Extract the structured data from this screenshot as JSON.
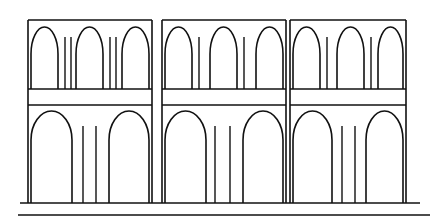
{
  "document": {
    "title": "Two-tier arcade elevation",
    "subject": "aqueduct-viaduct-facade-line-drawing",
    "background_color": "#ffffff",
    "ink_color": "#111111",
    "canvas": {
      "width": 442,
      "height": 223
    }
  },
  "drawing": {
    "type": "architectural-elevation",
    "orientation": "front",
    "bay_count": 3,
    "level_count": 2,
    "stroke_widths": {
      "outline": 1.6,
      "arch": 1.6,
      "pier_line": 1.4,
      "ground": 1.7,
      "ground_secondary": 1.5
    },
    "geometry": {
      "bay_left_edges": [
        28,
        162,
        290
      ],
      "bay_right_edges": [
        152,
        286,
        406
      ],
      "top_y": 20,
      "band_top_y": 89,
      "band_bottom_y": 105,
      "ground_y": 203,
      "ground_x_start": 20,
      "ground_x_end": 420,
      "ground_secondary_y": 215,
      "ground_secondary_x_start": 18,
      "ground_secondary_x_end": 430
    },
    "bays": [
      {
        "index": 1,
        "label": "bay-left",
        "x_left": 28,
        "x_right": 152,
        "upper": {
          "arch_count": 3,
          "arch_spring_y": 54,
          "arch_base_y": 89,
          "arches": [
            {
              "x_left": 31,
              "x_right": 58,
              "apex_y": 27
            },
            {
              "x_left": 76,
              "x_right": 103,
              "apex_y": 27
            },
            {
              "x_left": 122,
              "x_right": 149,
              "apex_y": 27
            }
          ],
          "pier_lines_x": [
            65,
            71,
            110,
            116
          ],
          "pier_line_top_y": 37,
          "pier_line_bottom_y": 89
        },
        "lower": {
          "arch_count": 2,
          "arch_spring_y": 140,
          "arch_base_y": 203,
          "arches": [
            {
              "x_left": 31,
              "x_right": 72,
              "apex_y": 111
            },
            {
              "x_left": 109,
              "x_right": 149,
              "apex_y": 111
            }
          ],
          "pier_lines_x": [
            83,
            96
          ],
          "pier_line_top_y": 126,
          "pier_line_bottom_y": 203
        }
      },
      {
        "index": 2,
        "label": "bay-center",
        "x_left": 162,
        "x_right": 286,
        "upper": {
          "arch_count": 3,
          "arch_spring_y": 54,
          "arch_base_y": 89,
          "arches": [
            {
              "x_left": 165,
              "x_right": 192,
              "apex_y": 27
            },
            {
              "x_left": 210,
              "x_right": 237,
              "apex_y": 27
            },
            {
              "x_left": 256,
              "x_right": 283,
              "apex_y": 27
            }
          ],
          "pier_lines_x": [
            199,
            244
          ],
          "pier_line_top_y": 37,
          "pier_line_bottom_y": 89
        },
        "lower": {
          "arch_count": 2,
          "arch_spring_y": 140,
          "arch_base_y": 203,
          "arches": [
            {
              "x_left": 165,
              "x_right": 206,
              "apex_y": 111
            },
            {
              "x_left": 243,
              "x_right": 283,
              "apex_y": 111
            }
          ],
          "pier_lines_x": [
            215,
            230
          ],
          "pier_line_top_y": 126,
          "pier_line_bottom_y": 203
        }
      },
      {
        "index": 3,
        "label": "bay-right",
        "x_left": 290,
        "x_right": 406,
        "upper": {
          "arch_count": 3,
          "arch_spring_y": 54,
          "arch_base_y": 89,
          "arches": [
            {
              "x_left": 293,
              "x_right": 320,
              "apex_y": 27
            },
            {
              "x_left": 337,
              "x_right": 364,
              "apex_y": 27
            },
            {
              "x_left": 378,
              "x_right": 403,
              "apex_y": 27
            }
          ],
          "pier_lines_x": [
            327,
            371
          ],
          "pier_line_top_y": 37,
          "pier_line_bottom_y": 89
        },
        "lower": {
          "arch_count": 2,
          "arch_spring_y": 140,
          "arch_base_y": 203,
          "arches": [
            {
              "x_left": 293,
              "x_right": 332,
              "apex_y": 111
            },
            {
              "x_left": 366,
              "x_right": 403,
              "apex_y": 111
            }
          ],
          "pier_lines_x": [
            342,
            355
          ],
          "pier_line_top_y": 126,
          "pier_line_bottom_y": 203
        }
      }
    ]
  }
}
